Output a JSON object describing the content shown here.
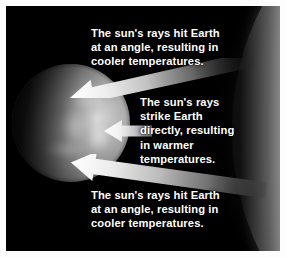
{
  "figure": {
    "background_color": "#000000",
    "border_color": "#ffffff"
  },
  "bodies": {
    "earth": {
      "name": "Earth",
      "position": "left",
      "color": "#a8a8a8"
    },
    "sun": {
      "name": "Sun",
      "position": "right",
      "color": "#eaeaea"
    }
  },
  "rays": [
    {
      "id": "ray-top",
      "label": "upper-oblique-ray",
      "direction": "left",
      "angle_deg": -12,
      "color": "#f0f0f0"
    },
    {
      "id": "ray-middle",
      "label": "equatorial-direct-ray",
      "direction": "left",
      "angle_deg": 0,
      "color": "#f4f4f4"
    },
    {
      "id": "ray-bottom",
      "label": "lower-oblique-ray",
      "direction": "left",
      "angle_deg": 10,
      "color": "#f0f0f0"
    }
  ],
  "captions": {
    "top": "The sun's rays hit Earth\nat an angle, resulting in\ncooler temperatures.",
    "middle": "The sun's rays\nstrike Earth\ndirectly, resulting\nin warmer\ntemperatures.",
    "bottom": "The sun's rays hit Earth\nat an angle, resulting in\ncooler temperatures."
  }
}
